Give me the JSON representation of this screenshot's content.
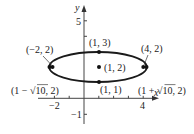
{
  "diagram": {
    "type": "ellipse-graph",
    "axes": {
      "x_label": "x",
      "y_label": "y",
      "x_ticks_labeled": [
        "−2",
        "4"
      ],
      "y_ticks_labeled": [
        "5",
        "−1"
      ],
      "x_range": [
        -2,
        5
      ],
      "y_range": [
        -1,
        5
      ]
    },
    "ellipse": {
      "center": [
        1,
        2
      ],
      "semi_major_horizontal": "√10",
      "semi_minor_vertical": 1
    },
    "points": [
      {
        "label": "(1, 3)",
        "x": 1,
        "y": 3
      },
      {
        "label": "(1, 2)",
        "x": 1,
        "y": 2
      },
      {
        "label": "(1, 1)",
        "x": 1,
        "y": 1
      },
      {
        "label": "(−2, 2)",
        "x": -2,
        "y": 2
      },
      {
        "label": "(4, 2)",
        "x": 4,
        "y": 2
      },
      {
        "label_prefix": "(1 − ",
        "label_root": "10",
        "label_suffix": ", 2)",
        "x": "1-√10",
        "y": 2
      },
      {
        "label_prefix": "(1 + ",
        "label_root": "10",
        "label_suffix": ", 2)",
        "x": "1+√10",
        "y": 2
      }
    ],
    "colors": {
      "ink": "#222222",
      "background": "#ffffff"
    }
  }
}
